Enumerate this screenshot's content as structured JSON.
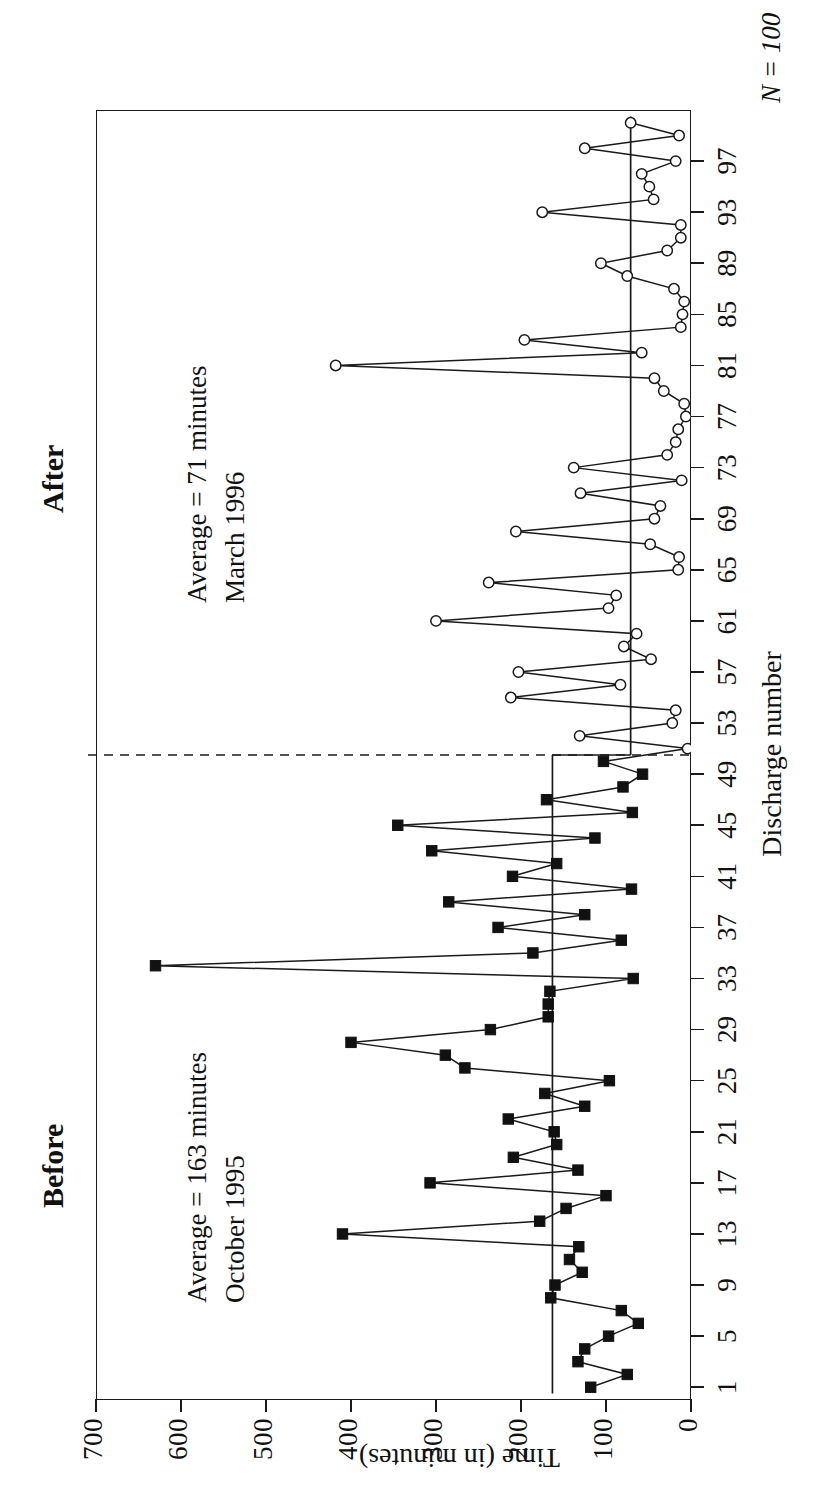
{
  "figure": {
    "n_label": "N = 100",
    "xlabel": "Discharge number",
    "ylabel": "Time (in minutes)"
  },
  "phases": [
    {
      "key": "before",
      "heading": "Before",
      "note_line1": "Average = 163 minutes",
      "note_line2": "October 1995",
      "marker": "filled-square",
      "mean": 163,
      "range": [
        1,
        50
      ]
    },
    {
      "key": "after",
      "heading": "After",
      "note_line1": "Average = 71 minutes",
      "note_line2": "March 1996",
      "marker": "open-circle",
      "mean": 71,
      "range": [
        51,
        100
      ]
    }
  ],
  "chart_data": {
    "type": "line",
    "title": "",
    "subtitle": "",
    "xlabel": "Discharge number",
    "ylabel": "Time (in minutes)",
    "xlim": [
      0,
      101
    ],
    "ylim": [
      0,
      700
    ],
    "ytick_values": [
      0,
      100,
      200,
      300,
      400,
      500,
      600,
      700
    ],
    "ytick_labels": [
      "0",
      "100",
      "200",
      "300",
      "400",
      "500",
      "600",
      "700"
    ],
    "xtick_values": [
      1,
      5,
      9,
      13,
      17,
      21,
      25,
      29,
      33,
      37,
      41,
      45,
      49,
      53,
      57,
      61,
      65,
      69,
      73,
      77,
      81,
      85,
      89,
      93,
      97
    ],
    "xtick_labels": [
      "1",
      "5",
      "9",
      "13",
      "17",
      "21",
      "25",
      "29",
      "33",
      "37",
      "41",
      "45",
      "49",
      "53",
      "57",
      "61",
      "65",
      "69",
      "73",
      "77",
      "81",
      "85",
      "89",
      "93",
      "97"
    ],
    "grid": false,
    "legend": "none",
    "x": [
      1,
      2,
      3,
      4,
      5,
      6,
      7,
      8,
      9,
      10,
      11,
      12,
      13,
      14,
      15,
      16,
      17,
      18,
      19,
      20,
      21,
      22,
      23,
      24,
      25,
      26,
      27,
      28,
      29,
      30,
      31,
      32,
      33,
      34,
      35,
      36,
      37,
      38,
      39,
      40,
      41,
      42,
      43,
      44,
      45,
      46,
      47,
      48,
      49,
      50,
      51,
      52,
      53,
      54,
      55,
      56,
      57,
      58,
      59,
      60,
      61,
      62,
      63,
      64,
      65,
      66,
      67,
      68,
      69,
      70,
      71,
      72,
      73,
      74,
      75,
      76,
      77,
      78,
      79,
      80,
      81,
      82,
      83,
      84,
      85,
      86,
      87,
      88,
      89,
      90,
      91,
      92,
      93,
      94,
      95,
      96,
      97,
      98,
      99,
      100
    ],
    "series": [
      {
        "name": "Before",
        "marker": "filled-square",
        "x": [
          1,
          2,
          3,
          4,
          5,
          6,
          7,
          8,
          9,
          10,
          11,
          12,
          13,
          14,
          15,
          16,
          17,
          18,
          19,
          20,
          21,
          22,
          23,
          24,
          25,
          26,
          27,
          28,
          29,
          30,
          31,
          32,
          33,
          34,
          35,
          36,
          37,
          38,
          39,
          40,
          41,
          42,
          43,
          44,
          45,
          46,
          47,
          48,
          49,
          50
        ],
        "values": [
          118,
          75,
          133,
          125,
          97,
          62,
          82,
          165,
          160,
          128,
          143,
          132,
          410,
          178,
          147,
          100,
          307,
          133,
          209,
          158,
          161,
          215,
          125,
          172,
          96,
          266,
          289,
          400,
          236,
          168,
          168,
          166,
          68,
          630,
          186,
          82,
          227,
          125,
          285,
          70,
          210,
          158,
          305,
          113,
          345,
          69,
          170,
          80,
          57,
          103
        ]
      },
      {
        "name": "After",
        "marker": "open-circle",
        "x": [
          51,
          52,
          53,
          54,
          55,
          56,
          57,
          58,
          59,
          60,
          61,
          62,
          63,
          64,
          65,
          66,
          67,
          68,
          69,
          70,
          71,
          72,
          73,
          74,
          75,
          76,
          77,
          78,
          79,
          80,
          81,
          82,
          83,
          84,
          85,
          86,
          87,
          88,
          89,
          90,
          91,
          92,
          93,
          94,
          95,
          96,
          97,
          98,
          99,
          100
        ],
        "values": [
          4,
          131,
          22,
          18,
          212,
          83,
          203,
          47,
          79,
          64,
          300,
          97,
          88,
          238,
          15,
          14,
          48,
          206,
          43,
          36,
          130,
          11,
          138,
          28,
          18,
          15,
          6,
          8,
          32,
          43,
          418,
          58,
          196,
          12,
          10,
          8,
          20,
          75,
          106,
          28,
          12,
          12,
          175,
          44,
          49,
          58,
          18,
          125,
          14,
          71
        ]
      }
    ],
    "mean_lines": [
      {
        "phase": "before",
        "value": 163,
        "x_from": 1,
        "x_to": 50
      },
      {
        "phase": "after",
        "value": 71,
        "x_from": 51,
        "x_to": 100
      }
    ],
    "divider": {
      "between": [
        50,
        51
      ],
      "style": "dashed"
    },
    "annotations": [
      {
        "text": "Before",
        "bold": true
      },
      {
        "text": "Average = 163 minutes"
      },
      {
        "text": "October 1995"
      },
      {
        "text": "After",
        "bold": true
      },
      {
        "text": "Average = 71 minutes"
      },
      {
        "text": "March 1996"
      },
      {
        "text": "N = 100"
      }
    ]
  }
}
